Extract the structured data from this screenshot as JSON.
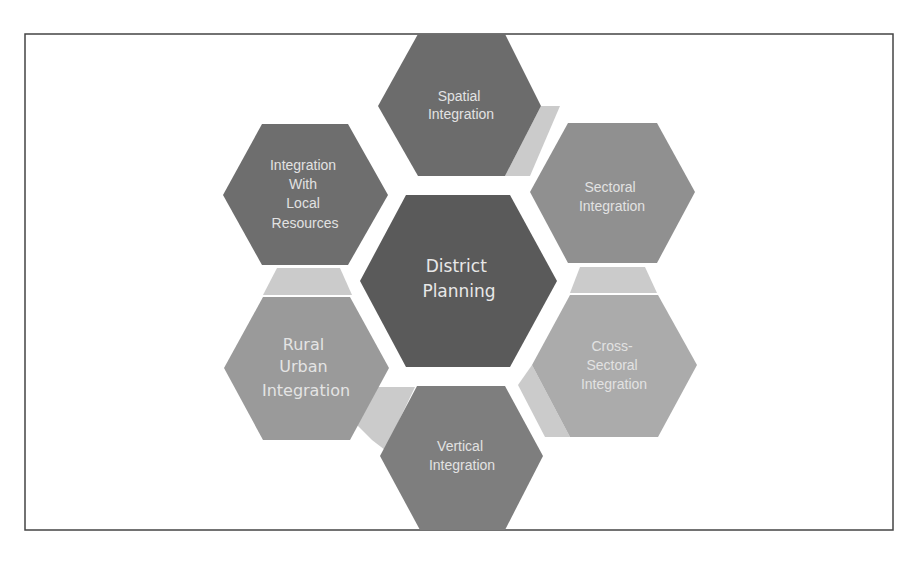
{
  "diagram": {
    "type": "hexagon-cluster",
    "center": {
      "label_lines": [
        "District",
        "Planning"
      ],
      "color": "#5a5a5a"
    },
    "nodes": [
      {
        "id": "spatial",
        "label_lines": [
          "Spatial",
          "Integration"
        ],
        "color": "#6c6c6c"
      },
      {
        "id": "sectoral",
        "label_lines": [
          "Sectoral",
          "Integration"
        ],
        "color": "#909090"
      },
      {
        "id": "cross-sectoral",
        "label_lines": [
          "Cross-",
          "Sectoral",
          "Integration"
        ],
        "color": "#ababab"
      },
      {
        "id": "vertical",
        "label_lines": [
          "Vertical",
          "Integration"
        ],
        "color": "#7e7e7e"
      },
      {
        "id": "rural-urban",
        "label_lines": [
          "Rural",
          "Urban",
          "Integration"
        ],
        "color": "#9a9a9a"
      },
      {
        "id": "local-resources",
        "label_lines": [
          "Integration",
          "With",
          "Local",
          "Resources"
        ],
        "color": "#6e6e6e"
      }
    ],
    "connector_color": "#cbcbcb",
    "frame_color": "#333333"
  }
}
